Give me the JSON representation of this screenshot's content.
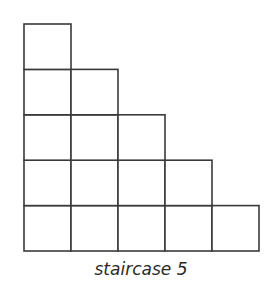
{
  "diagram": {
    "title": "staircase 5",
    "steps": 5,
    "stroke_color": "#3a3a3a",
    "fill_color": "#ffffff",
    "origin": {
      "x": 24,
      "y": 251
    },
    "cell_width": 47,
    "cell_height": 45.4,
    "columns": [
      {
        "index": 1,
        "height_cells": 5
      },
      {
        "index": 2,
        "height_cells": 4
      },
      {
        "index": 3,
        "height_cells": 3
      },
      {
        "index": 4,
        "height_cells": 2
      },
      {
        "index": 5,
        "height_cells": 1
      }
    ]
  }
}
